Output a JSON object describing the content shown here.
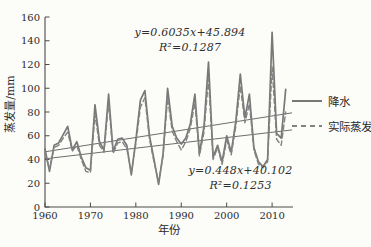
{
  "figure": {
    "background_color": "#fcfcf9",
    "axis_color": "#4a4a4a",
    "tick_text_color": "#2b2b2b",
    "series_solid_color": "#787878",
    "series_dashed_color": "#828282",
    "trend_line_color": "#5c5c5c"
  },
  "annotations": {
    "top_equation": "y=0.6035x+45.894",
    "top_r2": "R²=0.1287",
    "bottom_equation": "y=0.448x+40.102",
    "bottom_r2": "R²=0.1253"
  },
  "axes": {
    "xlabel": "年份",
    "ylabel": "蒸发量/mm"
  },
  "legend": {
    "items": [
      {
        "label": "降水",
        "style": "solid"
      },
      {
        "label": "实际蒸发",
        "style": "dashed"
      }
    ]
  },
  "chart_data": {
    "type": "line",
    "title": "",
    "xlabel": "年份",
    "ylabel": "蒸发量/mm",
    "xlim": [
      1960,
      2014.6
    ],
    "ylim": [
      0,
      160
    ],
    "x_ticks": [
      1960,
      1970,
      1980,
      1990,
      2000,
      2010
    ],
    "y_ticks": [
      0,
      20,
      40,
      60,
      80,
      100,
      120,
      140,
      160
    ],
    "grid": false,
    "legend_position": "right",
    "x": [
      1960,
      1961,
      1962,
      1963,
      1964,
      1965,
      1966,
      1967,
      1968,
      1969,
      1970,
      1971,
      1972,
      1973,
      1974,
      1975,
      1976,
      1977,
      1978,
      1979,
      1980,
      1981,
      1982,
      1983,
      1984,
      1985,
      1986,
      1987,
      1988,
      1989,
      1990,
      1991,
      1992,
      1993,
      1994,
      1995,
      1996,
      1997,
      1998,
      1999,
      2000,
      2001,
      2002,
      2003,
      2004,
      2005,
      2006,
      2007,
      2008,
      2009,
      2010,
      2011,
      2012,
      2013
    ],
    "series": [
      {
        "name": "降水",
        "style": "solid",
        "values": [
          49,
          30,
          52,
          54,
          61,
          68,
          48,
          55,
          42,
          33,
          31,
          86,
          55,
          48,
          95,
          47,
          57,
          58,
          52,
          27,
          56,
          90,
          98,
          60,
          40,
          19,
          45,
          100,
          68,
          58,
          53,
          58,
          70,
          95,
          45,
          68,
          122,
          42,
          52,
          38,
          60,
          46,
          72,
          112,
          75,
          95,
          50,
          38,
          34,
          40,
          147,
          62,
          58,
          99
        ]
      },
      {
        "name": "实际蒸发",
        "style": "dashed",
        "values": [
          46,
          32,
          50,
          52,
          58,
          63,
          47,
          52,
          40,
          30,
          29,
          78,
          52,
          46,
          88,
          45,
          54,
          55,
          49,
          29,
          53,
          84,
          92,
          57,
          38,
          21,
          43,
          92,
          64,
          55,
          48,
          55,
          66,
          88,
          43,
          63,
          108,
          40,
          50,
          36,
          56,
          44,
          68,
          102,
          71,
          87,
          48,
          36,
          33,
          38,
          118,
          57,
          52,
          80
        ]
      }
    ],
    "trend_lines": [
      {
        "for": "降水",
        "equation": "y=0.6035x+45.894",
        "r2": 0.1287,
        "start": {
          "x": 1960,
          "y": 46.5
        },
        "end": {
          "x": 2014.4,
          "y": 79.3
        }
      },
      {
        "for": "实际蒸发",
        "equation": "y=0.448x+40.102",
        "r2": 0.1253,
        "start": {
          "x": 1960,
          "y": 40.6
        },
        "end": {
          "x": 2014.4,
          "y": 64.9
        }
      }
    ]
  }
}
